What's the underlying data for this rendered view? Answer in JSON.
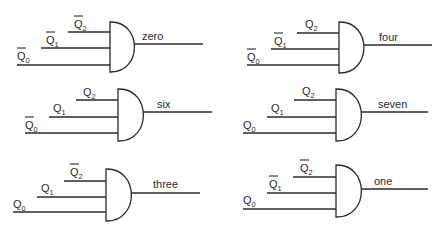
{
  "diagram": {
    "type": "logic-gate-decoder",
    "gates": [
      {
        "id": "zero",
        "output_label": "zero",
        "gate": {
          "left": 110,
          "top": 22,
          "bottom": 72,
          "out_y": 44,
          "out_end": 203
        },
        "label_pos": {
          "x": 142,
          "y": 40
        },
        "inputs": [
          {
            "name": "Q",
            "sub": "2",
            "inverted": true,
            "y": 32,
            "x_start": 68,
            "label_x": 74,
            "label_y": 28
          },
          {
            "name": "Q",
            "sub": "1",
            "inverted": true,
            "y": 48,
            "x_start": 41,
            "label_x": 46,
            "label_y": 44
          },
          {
            "name": "Q",
            "sub": "0",
            "inverted": true,
            "y": 65,
            "x_start": 17,
            "label_x": 17,
            "label_y": 60
          }
        ]
      },
      {
        "id": "four",
        "output_label": "four",
        "gate": {
          "left": 339,
          "top": 22,
          "bottom": 73,
          "out_y": 45,
          "out_end": 432
        },
        "label_pos": {
          "x": 379,
          "y": 41
        },
        "inputs": [
          {
            "name": "Q",
            "sub": "2",
            "inverted": false,
            "y": 33,
            "x_start": 297,
            "label_x": 305,
            "label_y": 28
          },
          {
            "name": "Q",
            "sub": "1",
            "inverted": true,
            "y": 49,
            "x_start": 271,
            "label_x": 274,
            "label_y": 45
          },
          {
            "name": "Q",
            "sub": "0",
            "inverted": true,
            "y": 65,
            "x_start": 247,
            "label_x": 247,
            "label_y": 61
          }
        ]
      },
      {
        "id": "six",
        "output_label": "six",
        "gate": {
          "left": 118,
          "top": 89,
          "bottom": 141,
          "out_y": 112,
          "out_end": 212
        },
        "label_pos": {
          "x": 157,
          "y": 108
        },
        "inputs": [
          {
            "name": "Q",
            "sub": "2",
            "inverted": false,
            "y": 100,
            "x_start": 76,
            "label_x": 83,
            "label_y": 96
          },
          {
            "name": "Q",
            "sub": "1",
            "inverted": false,
            "y": 117,
            "x_start": 49,
            "label_x": 53,
            "label_y": 112
          },
          {
            "name": "Q",
            "sub": "0",
            "inverted": true,
            "y": 133,
            "x_start": 25,
            "label_x": 25,
            "label_y": 129
          }
        ]
      },
      {
        "id": "seven",
        "output_label": "seven",
        "gate": {
          "left": 336,
          "top": 89,
          "bottom": 141,
          "out_y": 112,
          "out_end": 428
        },
        "label_pos": {
          "x": 378,
          "y": 108
        },
        "inputs": [
          {
            "name": "Q",
            "sub": "2",
            "inverted": false,
            "y": 100,
            "x_start": 294,
            "label_x": 302,
            "label_y": 95
          },
          {
            "name": "Q",
            "sub": "1",
            "inverted": false,
            "y": 117,
            "x_start": 267,
            "label_x": 271,
            "label_y": 112
          },
          {
            "name": "Q",
            "sub": "0",
            "inverted": false,
            "y": 133,
            "x_start": 243,
            "label_x": 243,
            "label_y": 129
          }
        ]
      },
      {
        "id": "three",
        "output_label": "three",
        "gate": {
          "left": 106,
          "top": 169,
          "bottom": 221,
          "out_y": 193,
          "out_end": 200
        },
        "label_pos": {
          "x": 153,
          "y": 188
        },
        "inputs": [
          {
            "name": "Q",
            "sub": "2",
            "inverted": true,
            "y": 181,
            "x_start": 64,
            "label_x": 70,
            "label_y": 176
          },
          {
            "name": "Q",
            "sub": "1",
            "inverted": false,
            "y": 197,
            "x_start": 37,
            "label_x": 41,
            "label_y": 192
          },
          {
            "name": "Q",
            "sub": "0",
            "inverted": false,
            "y": 212,
            "x_start": 13,
            "label_x": 13,
            "label_y": 208
          }
        ]
      },
      {
        "id": "one",
        "output_label": "one",
        "gate": {
          "left": 336,
          "top": 165,
          "bottom": 217,
          "out_y": 189,
          "out_end": 428
        },
        "label_pos": {
          "x": 374,
          "y": 185
        },
        "inputs": [
          {
            "name": "Q",
            "sub": "2",
            "inverted": true,
            "y": 177,
            "x_start": 293,
            "label_x": 300,
            "label_y": 172
          },
          {
            "name": "Q",
            "sub": "1",
            "inverted": true,
            "y": 193,
            "x_start": 267,
            "label_x": 269,
            "label_y": 188
          },
          {
            "name": "Q",
            "sub": "0",
            "inverted": false,
            "y": 209,
            "x_start": 243,
            "label_x": 243,
            "label_y": 204
          }
        ]
      }
    ]
  },
  "colors": {
    "stroke": "#2a2a2a",
    "background": "#ffffff"
  }
}
